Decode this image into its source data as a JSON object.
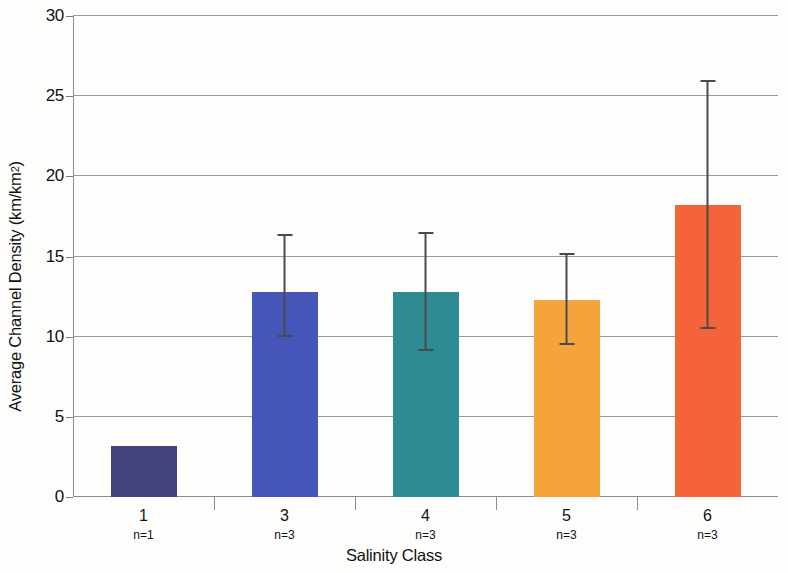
{
  "chart_data": {
    "type": "bar",
    "title": "",
    "xlabel": "Salinity Class",
    "ylabel": "Average Channel Density (km/km²)",
    "ylabel_base": "Average Channel Density (km/km",
    "ylabel_sup": "2",
    "ylabel_tail": ")",
    "categories": [
      "1",
      "3",
      "4",
      "5",
      "6"
    ],
    "sample_sizes": [
      "n=1",
      "n=3",
      "n=3",
      "n=3",
      "n=3"
    ],
    "values": [
      3.2,
      12.8,
      12.8,
      12.3,
      18.2
    ],
    "error_low": [
      null,
      10.0,
      9.1,
      9.5,
      10.5
    ],
    "error_high": [
      null,
      16.4,
      16.5,
      15.2,
      26.0
    ],
    "colors": [
      "#45437E",
      "#4555B8",
      "#2E8B94",
      "#F5A43C",
      "#F4633A"
    ],
    "ylim": [
      0,
      30
    ],
    "ytick_labels": [
      "0",
      "5",
      "10",
      "15",
      "20",
      "25",
      "30"
    ],
    "ytick_values": [
      0,
      5,
      10,
      15,
      20,
      25,
      30
    ],
    "grid": "horizontal",
    "legend": "none",
    "errorbar_color": "#4a4a4a",
    "axis_color": "#8d8d8d"
  }
}
